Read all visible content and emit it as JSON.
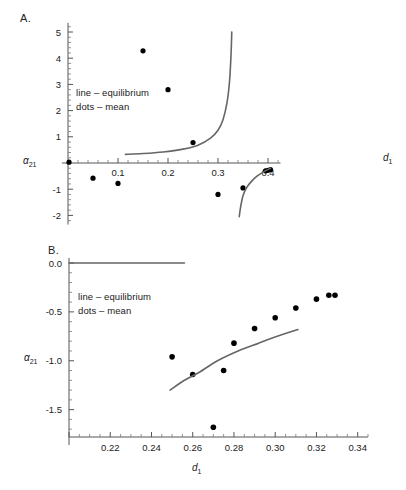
{
  "figure": {
    "panels": [
      {
        "id": "A",
        "label": "A.",
        "legend": [
          "line – equilibrium",
          "dots – mean"
        ],
        "xlabel": "d",
        "xlabel_sub": "1",
        "ylabel": "α",
        "ylabel_sub": "21"
      },
      {
        "id": "B",
        "label": "B.",
        "legend": [
          "line – equilibrium",
          "dots – mean"
        ],
        "xlabel": "d",
        "xlabel_sub": "1",
        "ylabel": "α",
        "ylabel_sub": "21"
      }
    ]
  },
  "chart_data": [
    {
      "type": "scatter",
      "panel": "A",
      "title": "A.",
      "xlabel": "d_1",
      "ylabel": "alpha_21",
      "xlim": [
        0.0,
        0.42
      ],
      "ylim": [
        -2.3,
        5.3
      ],
      "xticks": [
        0.1,
        0.2,
        0.3,
        0.4
      ],
      "xticklabels": [
        "0.1",
        "0.2",
        "0.3",
        "0.4"
      ],
      "yticks": [
        -2,
        -1,
        1,
        2,
        3,
        4,
        5
      ],
      "yticklabels": [
        "-2",
        "-1",
        "1",
        "2",
        "3",
        "4",
        "5"
      ],
      "xminor_step": 0.02,
      "yminor_step": 0.2,
      "grid": false,
      "legend": [
        "line – equilibrium",
        "dots – mean"
      ],
      "legend_position": "upper-left",
      "series": [
        {
          "name": "dots – mean",
          "type": "scatter",
          "x": [
            0.002,
            0.05,
            0.1,
            0.15,
            0.2,
            0.25,
            0.3,
            0.35,
            0.395,
            0.4,
            0.405
          ],
          "y": [
            0.03,
            -0.58,
            -0.78,
            4.28,
            2.8,
            0.78,
            -1.2,
            -0.95,
            -0.3,
            -0.28,
            -0.25
          ]
        },
        {
          "name": "line – equilibrium (branch 1)",
          "type": "line",
          "x": [
            0.115,
            0.15,
            0.19,
            0.23,
            0.26,
            0.285,
            0.3,
            0.31,
            0.318,
            0.323,
            0.326,
            0.3275
          ],
          "y": [
            0.33,
            0.36,
            0.42,
            0.53,
            0.68,
            0.95,
            1.25,
            1.65,
            2.3,
            3.1,
            4.1,
            5.0
          ]
        },
        {
          "name": "line – equilibrium (branch 2)",
          "type": "line",
          "x": [
            0.3425,
            0.345,
            0.35,
            0.357,
            0.366,
            0.378,
            0.392,
            0.405
          ],
          "y": [
            -2.05,
            -1.7,
            -1.25,
            -0.95,
            -0.72,
            -0.5,
            -0.33,
            -0.2
          ]
        }
      ]
    },
    {
      "type": "scatter",
      "panel": "B",
      "title": "B.",
      "xlabel": "d_1",
      "ylabel": "alpha_21",
      "xlim": [
        0.2,
        0.345
      ],
      "ylim": [
        -1.78,
        0.03
      ],
      "xticks": [
        0.22,
        0.24,
        0.26,
        0.28,
        0.3,
        0.32,
        0.34
      ],
      "xticklabels": [
        "0.22",
        "0.24",
        "0.26",
        "0.28",
        "0.30",
        "0.32",
        "0.34"
      ],
      "yticks": [
        0.0,
        -0.5,
        -1.0,
        -1.5
      ],
      "yticklabels": [
        "0.0",
        "-0.5",
        "-1.0",
        "-1.5"
      ],
      "xminor_step": 0.005,
      "yminor_step": 0.1,
      "grid": false,
      "legend": [
        "line – equilibrium",
        "dots – mean"
      ],
      "legend_position": "upper-left",
      "series": [
        {
          "name": "dots – mean",
          "type": "scatter",
          "x": [
            0.25,
            0.26,
            0.27,
            0.275,
            0.28,
            0.29,
            0.3,
            0.31,
            0.32,
            0.326,
            0.329
          ],
          "y": [
            -0.96,
            -1.14,
            -1.68,
            -1.1,
            -0.82,
            -0.67,
            -0.56,
            -0.46,
            -0.37,
            -0.33,
            -0.33
          ]
        },
        {
          "name": "line – equilibrium (flat branch)",
          "type": "line",
          "x": [
            0.2,
            0.256
          ],
          "y": [
            0.0,
            0.0
          ]
        },
        {
          "name": "line – equilibrium (rising branch)",
          "type": "line",
          "x": [
            0.249,
            0.256,
            0.263,
            0.272,
            0.282,
            0.292,
            0.301,
            0.311
          ],
          "y": [
            -1.3,
            -1.2,
            -1.12,
            -1.0,
            -0.9,
            -0.82,
            -0.75,
            -0.68
          ]
        }
      ]
    }
  ]
}
